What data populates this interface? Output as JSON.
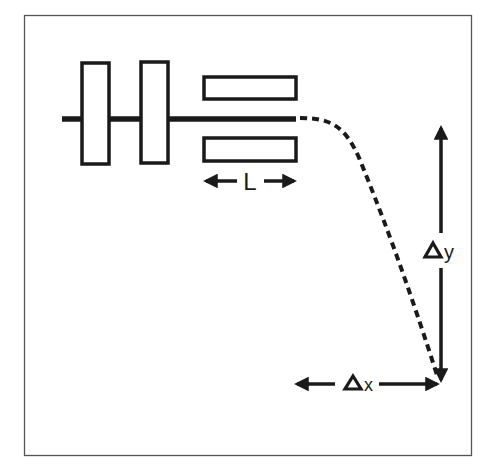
{
  "diagram": {
    "colors": {
      "stroke": "#1a1a1a",
      "frame": "#555555",
      "background": "#ffffff"
    },
    "labels": {
      "length": "L",
      "delta_y_symbol": "Δ",
      "delta_y_var": "y",
      "delta_x_symbol": "Δ",
      "delta_x_var": "x"
    },
    "components": [
      {
        "id": "lens-plate-1",
        "type": "vertical-plate"
      },
      {
        "id": "lens-plate-2",
        "type": "vertical-plate"
      },
      {
        "id": "deflector-upper",
        "type": "horizontal-plate"
      },
      {
        "id": "deflector-lower",
        "type": "horizontal-plate"
      },
      {
        "id": "beam-axis",
        "type": "solid-line"
      },
      {
        "id": "trajectory",
        "type": "dashed-curve"
      },
      {
        "id": "length-dimension",
        "type": "double-arrow",
        "label": "L"
      },
      {
        "id": "dy-dimension",
        "type": "double-arrow",
        "label": "Δy"
      },
      {
        "id": "dx-dimension",
        "type": "double-arrow",
        "label": "Δx"
      }
    ]
  }
}
